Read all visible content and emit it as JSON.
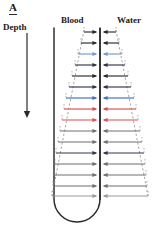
{
  "figure": {
    "panel_letter": "A",
    "labels": {
      "depth": "Depth",
      "blood": "Blood",
      "water": "Water"
    }
  },
  "colors": {
    "ink": "#2a2a2a",
    "dashed_outline": "#8c8c8c",
    "blue": "#3f6fbf",
    "light_blue": "#6f9ad6",
    "red": "#d94f4f",
    "dark_navy": "#2e3550",
    "grey": "#6f6f74",
    "light_grey": "#9a9a9e",
    "background": "#ffffff"
  },
  "chart_data": {
    "type": "diagram",
    "title": "A",
    "axis": {
      "name": "Depth",
      "direction": "downward",
      "arrow": true,
      "x": 27,
      "y_start": 33,
      "y_end": 117
    },
    "sides": [
      {
        "name": "Blood",
        "side": "left"
      },
      {
        "name": "Water",
        "side": "right"
      }
    ],
    "loop": {
      "shape": "u-tube",
      "left_x": 54,
      "right_x": 100,
      "top_y": 28,
      "bottom_y": 222,
      "radius": 23
    },
    "funnel": {
      "top_half_width": 16,
      "bottom_half_width": 48,
      "top_y": 30,
      "bottom_y": 196,
      "center_x": 100
    },
    "exchange_rows": [
      {
        "index": 1,
        "y": 32,
        "half_width": 16,
        "color_key": "ink",
        "arrows": "both"
      },
      {
        "index": 2,
        "y": 43,
        "half_width": 19,
        "color_key": "ink",
        "arrows": "both"
      },
      {
        "index": 3,
        "y": 54,
        "half_width": 22,
        "color_key": "light_blue",
        "arrows": "both"
      },
      {
        "index": 4,
        "y": 65,
        "half_width": 25,
        "color_key": "dark_navy",
        "arrows": "both"
      },
      {
        "index": 5,
        "y": 76,
        "half_width": 28,
        "color_key": "ink",
        "arrows": "both"
      },
      {
        "index": 6,
        "y": 87,
        "half_width": 31,
        "color_key": "dark_navy",
        "arrows": "both"
      },
      {
        "index": 7,
        "y": 98,
        "half_width": 34,
        "color_key": "blue",
        "arrows": "both"
      },
      {
        "index": 8,
        "y": 109,
        "half_width": 36,
        "color_key": "red",
        "arrows": "both"
      },
      {
        "index": 9,
        "y": 120,
        "half_width": 38,
        "color_key": "red",
        "arrows": "both"
      },
      {
        "index": 10,
        "y": 131,
        "half_width": 40,
        "color_key": "grey",
        "arrows": "both"
      },
      {
        "index": 11,
        "y": 142,
        "half_width": 42,
        "color_key": "grey",
        "arrows": "both"
      },
      {
        "index": 12,
        "y": 153,
        "half_width": 44,
        "color_key": "dark_navy",
        "arrows": "both"
      },
      {
        "index": 13,
        "y": 164,
        "half_width": 45,
        "color_key": "grey",
        "arrows": "both"
      },
      {
        "index": 14,
        "y": 175,
        "half_width": 46,
        "color_key": "grey",
        "arrows": "both"
      },
      {
        "index": 15,
        "y": 186,
        "half_width": 47,
        "color_key": "grey",
        "arrows": "both"
      },
      {
        "index": 16,
        "y": 196,
        "half_width": 48,
        "color_key": "light_grey",
        "arrows": "both"
      }
    ]
  }
}
